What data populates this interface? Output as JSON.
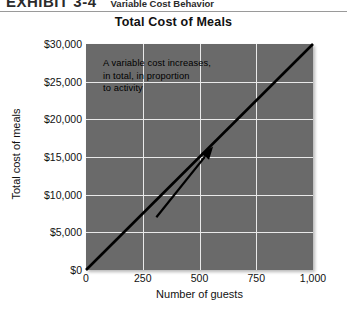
{
  "exhibit": {
    "label": "EXHIBIT 3-4",
    "caption": "Variable Cost Behavior"
  },
  "chart_data": {
    "type": "line",
    "title": "Total Cost of Meals",
    "xlabel": "Number of guests",
    "ylabel": "Total cost of meals",
    "xlim": [
      0,
      1000
    ],
    "ylim": [
      0,
      30000
    ],
    "grid": true,
    "legend": "none",
    "x_ticks": [
      0,
      250,
      500,
      750,
      1000
    ],
    "x_tick_labels": [
      "0",
      "250",
      "500",
      "750",
      "1,000"
    ],
    "y_ticks": [
      0,
      5000,
      10000,
      15000,
      20000,
      25000,
      30000
    ],
    "y_tick_labels": [
      "$0",
      "$5,000",
      "$10,000",
      "$15,000",
      "$20,000",
      "$25,000",
      "$30,000"
    ],
    "series": [
      {
        "name": "Total cost of meals",
        "color": "#000000",
        "x": [
          0,
          250,
          500,
          750,
          1000
        ],
        "values": [
          0,
          7500,
          15000,
          22500,
          30000
        ]
      }
    ],
    "annotations": [
      {
        "name": "variable-cost-note",
        "lines": [
          "A variable cost increases,",
          "in total, in proportion",
          "to activity"
        ],
        "arrow_from_x": 310,
        "arrow_from_y": 7000,
        "arrow_to_x": 560,
        "arrow_to_y": 16400
      }
    ],
    "plot_background": "#6a6a6a",
    "gridline_color": "#e9e9e9"
  }
}
